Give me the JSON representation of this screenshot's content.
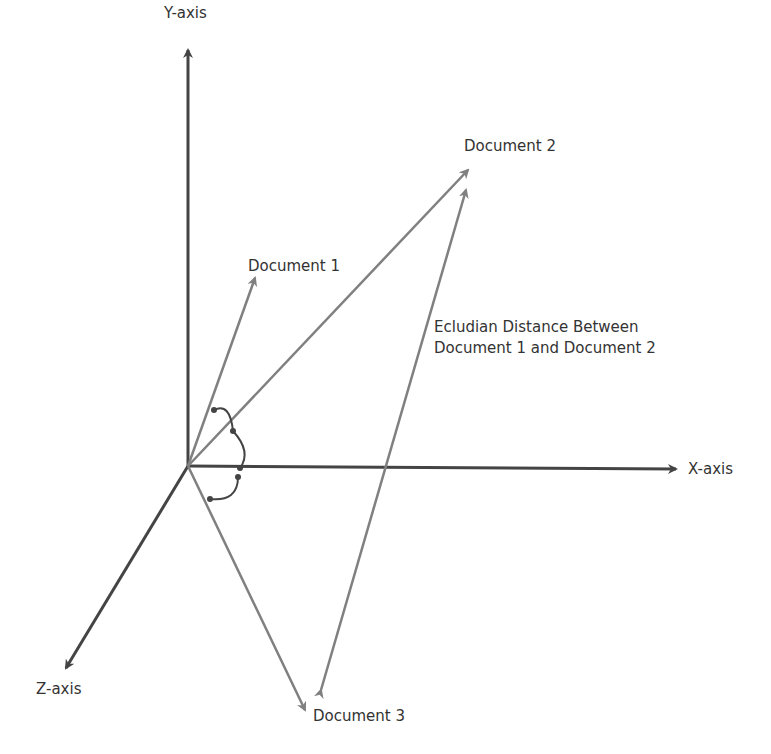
{
  "diagram": {
    "axes": {
      "y": "Y-axis",
      "x": "X-axis",
      "z": "Z-axis"
    },
    "vectors": [
      {
        "label": "Document 1"
      },
      {
        "label": "Document 2"
      },
      {
        "label": "Document 3"
      }
    ],
    "annotation": {
      "line1": "Ecludian Distance Between",
      "line2": "Document 1 and Document 2"
    },
    "colors": {
      "axis": "#444444",
      "vector": "#808080",
      "text": "#333333"
    }
  }
}
